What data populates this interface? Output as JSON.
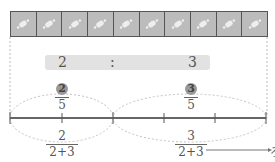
{
  "strip": {
    "cell_count": 10,
    "cell_icon": "candy-icon",
    "cell_color": "#bcbcbc",
    "border_color": "#555555"
  },
  "ratio": {
    "left": "2",
    "separator": ":",
    "right": "3",
    "bar_color": "#e2e2e2"
  },
  "markers": {
    "left_circle": "2",
    "right_circle": "3"
  },
  "fractions_above": {
    "left": {
      "numerator": "2",
      "denominator": "5"
    },
    "right": {
      "numerator": "3",
      "denominator": "5"
    }
  },
  "fractions_below": {
    "left": {
      "numerator": "2",
      "denominator": "2+3"
    },
    "right": {
      "numerator": "3",
      "denominator": "2+3"
    }
  },
  "number_line": {
    "segments": 5,
    "line_color": "#666666"
  },
  "arrow": {
    "target_glyph": "ろ"
  }
}
